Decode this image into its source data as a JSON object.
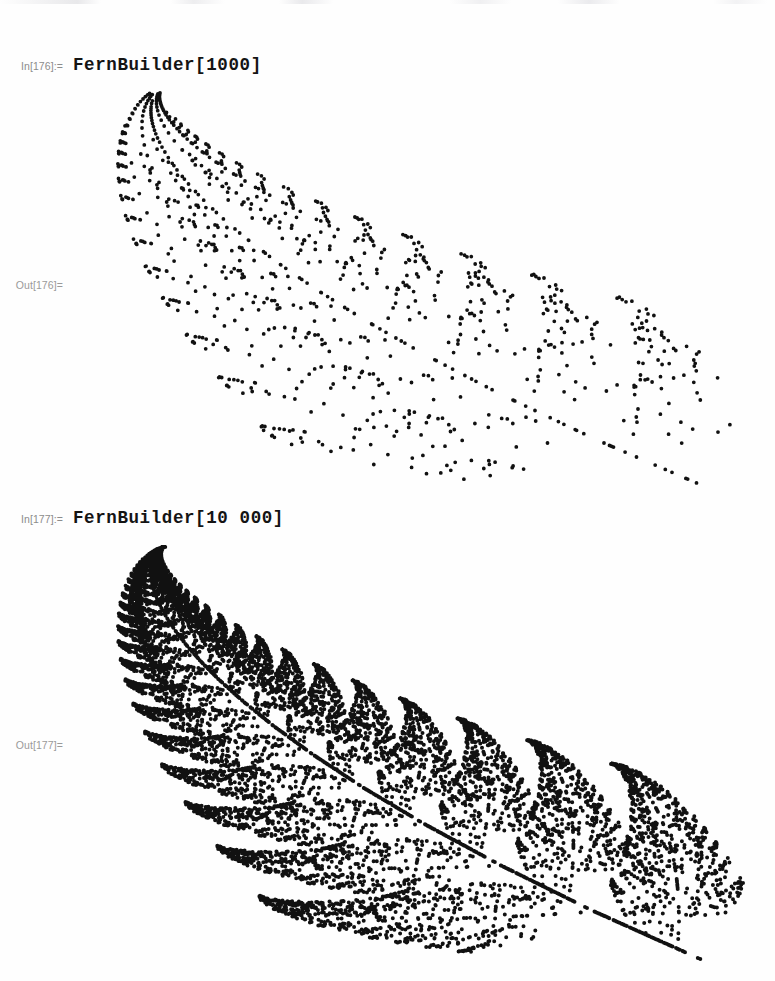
{
  "app": {
    "kind": "mathematica-notebook",
    "background_color": "#ffffff",
    "label_color": "#8c8c8c",
    "code_color": "#141414",
    "plot_point_color": "#111111"
  },
  "cells": [
    {
      "type": "input",
      "label": "In[176]:=",
      "code": "FernBuilder[1000]",
      "label_name": "in-label-176"
    },
    {
      "type": "output",
      "label": "Out[176]=",
      "label_name": "out-label-176",
      "graphic": "barnsley-fern-1000"
    },
    {
      "type": "input",
      "label": "In[177]:=",
      "code": "FernBuilder[10 000]",
      "label_name": "in-label-177"
    },
    {
      "type": "output",
      "label": "Out[177]=",
      "label_name": "out-label-177",
      "graphic": "barnsley-fern-10000"
    }
  ],
  "chart_data": [
    {
      "id": "barnsley-fern-1000",
      "type": "scatter",
      "title": "",
      "xlabel": "",
      "ylabel": "",
      "point_count": 1000,
      "point_radius_px": 1.9,
      "point_color": "#111111",
      "grid": false,
      "axes": false,
      "legend": false,
      "description": "Barnsley fern IFS attractor rendered as a point scatter, rotated so the frond tip points to the upper right",
      "ifs_name": "barnsley-fern",
      "seed": 176,
      "xlim": [
        -2.2,
        2.7
      ],
      "ylim": [
        0,
        10
      ],
      "transforms": [
        {
          "name": "stem",
          "p": 0.01,
          "a": 0.0,
          "b": 0.0,
          "c": 0.0,
          "d": 0.16,
          "e": 0.0,
          "f": 0.0
        },
        {
          "name": "successive",
          "p": 0.85,
          "a": 0.85,
          "b": 0.04,
          "c": -0.04,
          "d": 0.85,
          "e": 0.0,
          "f": 1.6
        },
        {
          "name": "left-leaflet",
          "p": 0.07,
          "a": 0.2,
          "b": -0.26,
          "c": 0.23,
          "d": 0.22,
          "e": 0.0,
          "f": 1.6
        },
        {
          "name": "right-leaflet",
          "p": 0.07,
          "a": -0.15,
          "b": 0.28,
          "c": 0.26,
          "d": 0.24,
          "e": 0.0,
          "f": 0.44
        }
      ],
      "view": {
        "plot_left_px": 118,
        "plot_top_px": 95,
        "plot_width_px": 612,
        "plot_height_px": 390,
        "rotation_deg": 48,
        "stem_base_px": [
          394,
          482
        ],
        "tip_px": [
          722,
          101
        ]
      }
    },
    {
      "id": "barnsley-fern-10000",
      "type": "scatter",
      "title": "",
      "xlabel": "",
      "ylabel": "",
      "point_count": 10000,
      "point_radius_px": 2.0,
      "point_color": "#111111",
      "grid": false,
      "axes": false,
      "legend": false,
      "description": "Barnsley fern IFS attractor with 10000 points; fronds are dense and nearly solid",
      "ifs_name": "barnsley-fern",
      "seed": 177,
      "xlim": [
        -2.2,
        2.7
      ],
      "ylim": [
        0,
        10
      ],
      "transforms": [
        {
          "name": "stem",
          "p": 0.01,
          "a": 0.0,
          "b": 0.0,
          "c": 0.0,
          "d": 0.16,
          "e": 0.0,
          "f": 0.0
        },
        {
          "name": "successive",
          "p": 0.85,
          "a": 0.85,
          "b": 0.04,
          "c": -0.04,
          "d": 0.85,
          "e": 0.0,
          "f": 1.6
        },
        {
          "name": "left-leaflet",
          "p": 0.07,
          "a": 0.2,
          "b": -0.26,
          "c": 0.23,
          "d": 0.22,
          "e": 0.0,
          "f": 1.6
        },
        {
          "name": "right-leaflet",
          "p": 0.07,
          "a": -0.15,
          "b": 0.28,
          "c": 0.26,
          "d": 0.24,
          "e": 0.0,
          "f": 0.44
        }
      ],
      "view": {
        "plot_left_px": 118,
        "plot_top_px": 548,
        "plot_width_px": 625,
        "plot_height_px": 412,
        "rotation_deg": 48,
        "stem_base_px": [
          398,
          955
        ],
        "tip_px": [
          736,
          562
        ]
      }
    }
  ],
  "layout": {
    "in176_top": 55,
    "out176_label_top": 279,
    "out176_graphic_top": 88,
    "in177_top": 508,
    "out177_label_top": 739,
    "out177_graphic_top": 542
  }
}
